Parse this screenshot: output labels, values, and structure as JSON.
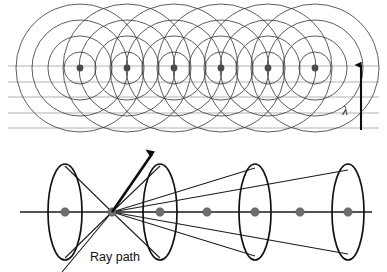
{
  "figure": {
    "background_color": "#ffffff",
    "panels": [
      {
        "name": "upper-panel",
        "description": "Array of point sources emitting concentric circular wavefronts with horizontal wavefront lines and a wavelength marker"
      },
      {
        "name": "lower-panel",
        "description": "Axis with point scatterers, elliptical wave shells and ray paths converging at a vertex"
      }
    ]
  },
  "colors": {
    "circle_stroke": "#3f3f3f",
    "wavefront_line": "#b3b3b3",
    "source_dot": "#4a4a4a",
    "axis_stroke": "#1a1a1a",
    "ellipse_stroke": "#111111",
    "ray_stroke": "#1a1a1a",
    "arrow_stroke": "#0d0d0d",
    "dot_fill": "#6e6e6e",
    "text_color": "#121212"
  },
  "upper": {
    "label_lambda": "λ",
    "lambda_label_x": 345,
    "lambda_label_y": 115,
    "source_dots": [
      {
        "cx": 80,
        "cy": 68,
        "r": 3.4
      },
      {
        "cx": 127,
        "cy": 68,
        "r": 3.4
      },
      {
        "cx": 174,
        "cy": 68,
        "r": 3.4
      },
      {
        "cx": 221,
        "cy": 68,
        "r": 3.4
      },
      {
        "cx": 268,
        "cy": 68,
        "r": 3.4
      },
      {
        "cx": 315,
        "cy": 68,
        "r": 3.4
      }
    ],
    "circle_radii": [
      16,
      32,
      48,
      64
    ],
    "wavefront_lines": [
      {
        "x1": 8,
        "y1": 66,
        "x2": 379,
        "y2": 66
      },
      {
        "x1": 8,
        "y1": 82,
        "x2": 379,
        "y2": 82
      },
      {
        "x1": 8,
        "y1": 97,
        "x2": 379,
        "y2": 97
      },
      {
        "x1": 8,
        "y1": 113,
        "x2": 379,
        "y2": 113
      },
      {
        "x1": 8,
        "y1": 128,
        "x2": 379,
        "y2": 128
      }
    ],
    "wavelength_arrow": {
      "x": 361,
      "y_top": 65,
      "y_bottom": 130,
      "description": "vertical arrow indicating one wavelength spacing"
    }
  },
  "lower": {
    "label_ray_path": "Ray path",
    "ray_path_label_x": 90,
    "ray_path_label_y": 261,
    "axis": {
      "x1": 20,
      "y1": 212,
      "x2": 372,
      "y2": 212
    },
    "vertex": {
      "x": 112,
      "y": 212
    },
    "ellipses": [
      {
        "cx": 65,
        "cy": 212,
        "rx": 17,
        "ry": 48
      },
      {
        "cx": 160,
        "cy": 212,
        "rx": 17,
        "ry": 48
      },
      {
        "cx": 255,
        "cy": 212,
        "rx": 16,
        "ry": 48
      },
      {
        "cx": 348,
        "cy": 212,
        "rx": 16,
        "ry": 48
      }
    ],
    "axis_dots": [
      {
        "cx": 65,
        "cy": 212,
        "r": 4.2
      },
      {
        "cx": 112,
        "cy": 212,
        "r": 4.2
      },
      {
        "cx": 160,
        "cy": 212,
        "r": 4.2
      },
      {
        "cx": 207,
        "cy": 212,
        "r": 4.2
      },
      {
        "cx": 255,
        "cy": 212,
        "r": 4.2
      },
      {
        "cx": 300,
        "cy": 212,
        "r": 4.2
      },
      {
        "cx": 348,
        "cy": 212,
        "r": 4.2
      }
    ],
    "rays": [
      {
        "x1": 112,
        "y1": 212,
        "x2": 65,
        "y2": 166
      },
      {
        "x1": 112,
        "y1": 212,
        "x2": 65,
        "y2": 258
      },
      {
        "x1": 112,
        "y1": 212,
        "x2": 160,
        "y2": 166
      },
      {
        "x1": 112,
        "y1": 212,
        "x2": 160,
        "y2": 258
      },
      {
        "x1": 112,
        "y1": 212,
        "x2": 255,
        "y2": 168
      },
      {
        "x1": 112,
        "y1": 212,
        "x2": 255,
        "y2": 256
      },
      {
        "x1": 112,
        "y1": 212,
        "x2": 348,
        "y2": 170
      },
      {
        "x1": 112,
        "y1": 212,
        "x2": 348,
        "y2": 254
      },
      {
        "x1": 112,
        "y1": 212,
        "x2": 62,
        "y2": 272
      }
    ],
    "ray_arrow": {
      "x1": 112,
      "y1": 212,
      "x2": 152,
      "y2": 154,
      "description": "thick arrow showing outgoing ray direction"
    }
  }
}
